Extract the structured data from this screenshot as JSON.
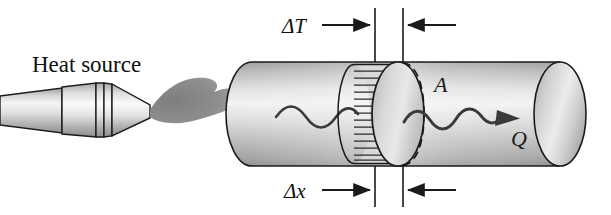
{
  "figure": {
    "type": "physics-diagram",
    "width": 611,
    "height": 215,
    "background": "#ffffff"
  },
  "labels": {
    "heat_source": "Heat source",
    "delta_t": "ΔT",
    "delta_x": "Δx",
    "area": "A",
    "heat_flow": "Q"
  },
  "elements": {
    "torch": {
      "name": "heat source torch",
      "flame_label": "flame",
      "nozzle_label": "nozzle"
    },
    "rod": {
      "name": "cylindrical rod",
      "left_cap": "rounded end cap",
      "right_cap": "elliptical end cap"
    },
    "slab": {
      "name": "hatched slab element",
      "hatch_lines": 13,
      "thickness_label": "Δx"
    },
    "cross_section": {
      "name": "dashed cross-section ellipse",
      "label": "A"
    },
    "wave_left": "heat wave entering rod",
    "wave_right": "heat wave exiting rod with arrow"
  },
  "dimension_lines": {
    "left_extension_x": 375,
    "right_extension_x": 403,
    "top_label": "ΔT",
    "bottom_label": "Δx",
    "arrow_direction_left": "right",
    "arrow_direction_right": "left"
  },
  "colors": {
    "stroke": "#1a1a1a",
    "rod_light": "#f4f4f4",
    "rod_mid": "#c9c9c9",
    "rod_dark": "#9a9a9a",
    "flame": "#8e8e8e",
    "background": "#ffffff",
    "hatch": "#2a2a2a"
  }
}
